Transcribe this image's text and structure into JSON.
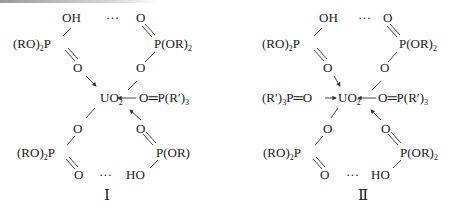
{
  "structures": [
    {
      "label": "Ⅰ",
      "top_left": {
        "oh": "OH",
        "dots": "···",
        "p_group_pre": "(RO)",
        "p_group_sub": "2",
        "p_group_post": "P",
        "o_lower": "O"
      },
      "top_right": {
        "o_upper": "O",
        "p_group_pre": "P(OR)",
        "p_group_sub": "2",
        "o_lower": "O"
      },
      "center": {
        "uo2_pre": "UO",
        "uo2_sub": "2",
        "right_ligand_pre": "O═P(R′)",
        "right_ligand_sub": "3"
      },
      "bottom_left": {
        "o_upper": "O",
        "p_group_pre": "(RO)",
        "p_group_sub": "2",
        "p_group_post": "P",
        "o_lower": "O",
        "dots": "···"
      },
      "bottom_right": {
        "o_upper": "O",
        "p_group": "P(OR)",
        "ho": "HO"
      }
    },
    {
      "label": "Ⅱ",
      "top_left": {
        "oh": "OH",
        "dots": "···",
        "p_group_pre": "(RO)",
        "p_group_sub": "2",
        "p_group_post": "P",
        "o_lower": "O"
      },
      "top_right": {
        "o_upper": "O",
        "p_group_pre": "P(OR)",
        "p_group_sub": "2",
        "o_lower": "O"
      },
      "center": {
        "left_ligand_pre": "(R′)",
        "left_ligand_sub": "3",
        "left_ligand_post": "P═O",
        "uo2_pre": "UO",
        "uo2_sub": "2",
        "right_ligand_pre": "O═P(R′)",
        "right_ligand_sub": "3"
      },
      "bottom_left": {
        "o_upper": "O",
        "p_group_pre": "(RO)",
        "p_group_sub": "2",
        "p_group_post": "P",
        "o_lower": "O",
        "dots": "···"
      },
      "bottom_right": {
        "o_upper": "O",
        "p_group_pre": "P(OR)",
        "p_group_sub": "2",
        "ho": "HO"
      }
    }
  ]
}
